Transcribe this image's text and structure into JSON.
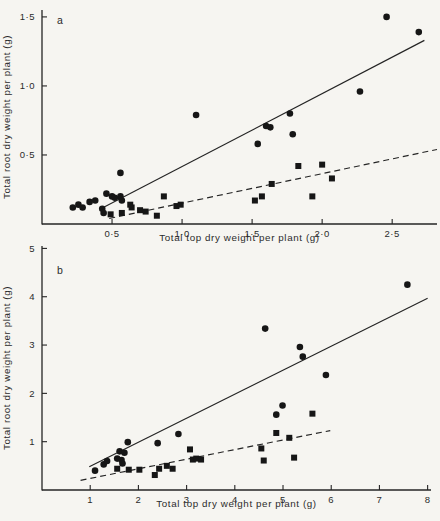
{
  "figure": {
    "paper_color": "#f6f5f1",
    "ink_color": "#242424",
    "marker_color": "#161616"
  },
  "chart_data": [
    {
      "type": "scatter",
      "panel_letter": "a",
      "xlabel": "Total top dry weight per plant (g)",
      "ylabel": "Total root dry weight per plant (g)",
      "xlim": [
        0,
        2.82
      ],
      "ylim": [
        0,
        1.55
      ],
      "xticks": [
        {
          "v": 0.5,
          "label": "0·5"
        },
        {
          "v": 1.0,
          "label": "1·0"
        },
        {
          "v": 1.5,
          "label": "1·5"
        },
        {
          "v": 2.0,
          "label": "2·0"
        },
        {
          "v": 2.5,
          "label": "2·5"
        }
      ],
      "yticks": [
        {
          "v": 0.5,
          "label": "0·5"
        },
        {
          "v": 1.0,
          "label": "1·0"
        },
        {
          "v": 1.5,
          "label": "1·5"
        }
      ],
      "series": [
        {
          "name": "circles",
          "marker": "circle",
          "points": [
            [
              0.22,
              0.12
            ],
            [
              0.26,
              0.14
            ],
            [
              0.29,
              0.12
            ],
            [
              0.34,
              0.16
            ],
            [
              0.38,
              0.17
            ],
            [
              0.43,
              0.11
            ],
            [
              0.44,
              0.08
            ],
            [
              0.46,
              0.22
            ],
            [
              0.5,
              0.2
            ],
            [
              0.52,
              0.19
            ],
            [
              0.56,
              0.2
            ],
            [
              0.57,
              0.17
            ],
            [
              0.56,
              0.37
            ],
            [
              1.1,
              0.79
            ],
            [
              1.54,
              0.58
            ],
            [
              1.6,
              0.71
            ],
            [
              1.63,
              0.7
            ],
            [
              1.77,
              0.8
            ],
            [
              1.79,
              0.65
            ],
            [
              2.27,
              0.96
            ],
            [
              2.46,
              1.5
            ],
            [
              2.69,
              1.39
            ]
          ]
        },
        {
          "name": "squares",
          "marker": "square",
          "points": [
            [
              0.49,
              0.07
            ],
            [
              0.57,
              0.08
            ],
            [
              0.63,
              0.14
            ],
            [
              0.64,
              0.12
            ],
            [
              0.7,
              0.1
            ],
            [
              0.74,
              0.09
            ],
            [
              0.82,
              0.06
            ],
            [
              0.87,
              0.2
            ],
            [
              0.96,
              0.13
            ],
            [
              0.99,
              0.14
            ],
            [
              1.52,
              0.17
            ],
            [
              1.57,
              0.2
            ],
            [
              1.64,
              0.29
            ],
            [
              1.83,
              0.42
            ],
            [
              1.93,
              0.2
            ],
            [
              2.0,
              0.43
            ],
            [
              2.07,
              0.33
            ]
          ]
        }
      ],
      "fit_lines": [
        {
          "style": "solid",
          "x1": 0.42,
          "y1": 0.11,
          "x2": 2.73,
          "y2": 1.33
        },
        {
          "style": "dashed",
          "x1": 0.48,
          "y1": 0.04,
          "x2": 2.82,
          "y2": 0.54
        }
      ]
    },
    {
      "type": "scatter",
      "panel_letter": "b",
      "xlabel": "Total top dry weight per plant (g)",
      "ylabel": "Total root dry weight per plant (g)",
      "xlim": [
        0,
        8.07
      ],
      "ylim": [
        0,
        5.05
      ],
      "xticks": [
        {
          "v": 1,
          "label": "1"
        },
        {
          "v": 2,
          "label": "2"
        },
        {
          "v": 3,
          "label": "3"
        },
        {
          "v": 4,
          "label": "4"
        },
        {
          "v": 5,
          "label": "5"
        },
        {
          "v": 6,
          "label": "6"
        },
        {
          "v": 7,
          "label": "7"
        },
        {
          "v": 8,
          "label": "8"
        }
      ],
      "yticks": [
        {
          "v": 1,
          "label": "1"
        },
        {
          "v": 2,
          "label": "2"
        },
        {
          "v": 3,
          "label": "3"
        },
        {
          "v": 4,
          "label": "4"
        },
        {
          "v": 5,
          "label": "5"
        }
      ],
      "series": [
        {
          "name": "circles",
          "marker": "circle",
          "points": [
            [
              1.1,
              0.4
            ],
            [
              1.28,
              0.53
            ],
            [
              1.35,
              0.6
            ],
            [
              1.56,
              0.65
            ],
            [
              1.61,
              0.8
            ],
            [
              1.65,
              0.62
            ],
            [
              1.67,
              0.55
            ],
            [
              1.71,
              0.77
            ],
            [
              1.78,
              0.99
            ],
            [
              2.4,
              0.97
            ],
            [
              2.83,
              1.16
            ],
            [
              4.63,
              3.34
            ],
            [
              4.86,
              1.56
            ],
            [
              4.99,
              1.75
            ],
            [
              5.35,
              2.96
            ],
            [
              5.41,
              2.76
            ],
            [
              5.89,
              2.38
            ],
            [
              7.58,
              4.25
            ]
          ]
        },
        {
          "name": "squares",
          "marker": "square",
          "points": [
            [
              1.56,
              0.44
            ],
            [
              1.8,
              0.42
            ],
            [
              2.02,
              0.42
            ],
            [
              2.34,
              0.31
            ],
            [
              2.43,
              0.44
            ],
            [
              2.59,
              0.5
            ],
            [
              2.71,
              0.44
            ],
            [
              3.07,
              0.84
            ],
            [
              3.13,
              0.63
            ],
            [
              3.2,
              0.65
            ],
            [
              3.3,
              0.63
            ],
            [
              4.55,
              0.86
            ],
            [
              4.6,
              0.61
            ],
            [
              4.86,
              1.18
            ],
            [
              5.13,
              1.08
            ],
            [
              5.23,
              0.67
            ],
            [
              5.61,
              1.58
            ]
          ]
        }
      ],
      "fit_lines": [
        {
          "style": "solid",
          "x1": 0.98,
          "y1": 0.48,
          "x2": 8.0,
          "y2": 3.97
        },
        {
          "style": "dashed",
          "x1": 0.8,
          "y1": 0.2,
          "x2": 5.98,
          "y2": 1.23
        }
      ]
    }
  ]
}
